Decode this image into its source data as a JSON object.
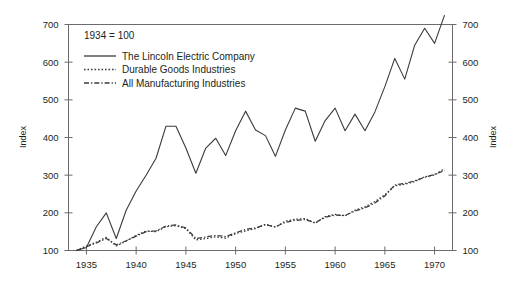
{
  "chart_data": {
    "type": "line",
    "title": "",
    "note": "1934 = 100",
    "xlabel": "",
    "ylabel": "Index",
    "ylabel_right": "Index",
    "xlim": [
      1933.2,
      1971.8
    ],
    "ylim": [
      100,
      700
    ],
    "yticks": [
      100,
      200,
      300,
      400,
      500,
      600,
      700
    ],
    "xticks": [
      1935,
      1940,
      1945,
      1950,
      1955,
      1960,
      1965,
      1970
    ],
    "grid": false,
    "legend_position": "top-left",
    "frame": "box",
    "line_color": "#3c3a3b",
    "x": [
      1934,
      1935,
      1936,
      1937,
      1938,
      1939,
      1940,
      1941,
      1942,
      1943,
      1944,
      1945,
      1946,
      1947,
      1948,
      1949,
      1950,
      1951,
      1952,
      1953,
      1954,
      1955,
      1956,
      1957,
      1958,
      1959,
      1960,
      1961,
      1962,
      1963,
      1964,
      1965,
      1966,
      1967,
      1968,
      1969,
      1970,
      1971
    ],
    "series": [
      {
        "name": "The Lincoln Electric Company",
        "style": "solid",
        "values": [
          100,
          108,
          163,
          200,
          132,
          207,
          258,
          300,
          345,
          430,
          430,
          372,
          305,
          372,
          398,
          352,
          418,
          470,
          420,
          405,
          350,
          420,
          478,
          470,
          390,
          445,
          478,
          418,
          462,
          418,
          468,
          535,
          610,
          555,
          645,
          690,
          650,
          725
        ]
      },
      {
        "name": "Durable Goods Industries",
        "style": "dotted",
        "values": [
          100,
          112,
          122,
          135,
          112,
          125,
          140,
          152,
          150,
          163,
          166,
          158,
          128,
          132,
          136,
          133,
          145,
          152,
          158,
          170,
          162,
          178,
          183,
          185,
          172,
          190,
          196,
          192,
          207,
          216,
          230,
          248,
          272,
          276,
          283,
          296,
          300,
          318
        ]
      },
      {
        "name": "All Manufacturing Industries",
        "style": "dashdot",
        "values": [
          100,
          110,
          120,
          132,
          115,
          126,
          138,
          150,
          152,
          165,
          168,
          160,
          132,
          136,
          140,
          137,
          147,
          156,
          160,
          168,
          163,
          175,
          180,
          182,
          174,
          188,
          194,
          193,
          205,
          213,
          226,
          245,
          274,
          278,
          285,
          294,
          302,
          312
        ]
      }
    ]
  },
  "legend": {
    "items": [
      {
        "label": "The Lincoln Electric Company",
        "style": "solid"
      },
      {
        "label": "Durable Goods Industries",
        "style": "dotted"
      },
      {
        "label": "All Manufacturing Industries",
        "style": "dashdot"
      }
    ]
  }
}
